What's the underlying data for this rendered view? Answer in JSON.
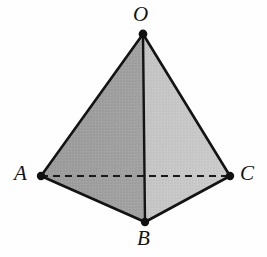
{
  "figure": {
    "name": "tetrahedron-OABC",
    "kind": "geometry-diagram",
    "background_color": "#fefefe",
    "stroke_color": "#131313",
    "stroke_width": 2.4,
    "vertex_dot_radius": 4.2,
    "vertices": [
      {
        "id": "O",
        "label": "O",
        "x": 143,
        "y": 34,
        "role": "apex",
        "label_x": 133,
        "label_y": 4
      },
      {
        "id": "A",
        "label": "A",
        "x": 41,
        "y": 176,
        "role": "base",
        "label_x": 14,
        "label_y": 163
      },
      {
        "id": "B",
        "label": "B",
        "x": 145,
        "y": 222,
        "role": "base-front",
        "label_x": 137,
        "label_y": 228
      },
      {
        "id": "C",
        "label": "C",
        "x": 230,
        "y": 176,
        "role": "base",
        "label_x": 240,
        "label_y": 163
      }
    ],
    "faces": [
      {
        "id": "OAB",
        "label": "face-OAB",
        "points": "143,34 41,176 145,222",
        "fill": "#9d9d9d",
        "visible": true
      },
      {
        "id": "OBC",
        "label": "face-OBC",
        "points": "143,34 145,222 230,176",
        "fill": "#c6c6c6",
        "visible": true
      }
    ],
    "edges": [
      {
        "id": "OA",
        "label": "edge-OA",
        "from": "O",
        "to": "A",
        "style": "solid"
      },
      {
        "id": "OC",
        "label": "edge-OC",
        "from": "O",
        "to": "C",
        "style": "solid"
      },
      {
        "id": "OB",
        "label": "edge-OB",
        "from": "O",
        "to": "B",
        "style": "solid"
      },
      {
        "id": "AB",
        "label": "edge-AB",
        "from": "A",
        "to": "B",
        "style": "solid"
      },
      {
        "id": "BC",
        "label": "edge-BC",
        "from": "B",
        "to": "C",
        "style": "solid"
      },
      {
        "id": "AC",
        "label": "edge-AC",
        "from": "A",
        "to": "C",
        "style": "dashed",
        "note": "hidden edge"
      }
    ],
    "dash_pattern": "7 5"
  },
  "labels": {
    "O": "O",
    "A": "A",
    "B": "B",
    "C": "C"
  },
  "colors": {
    "background": "#fefefe",
    "stroke": "#131313",
    "face_left": "#9d9d9d",
    "face_right": "#c6c6c6",
    "dashed_edge": "#1a1a1a",
    "label_text": "#131313"
  }
}
